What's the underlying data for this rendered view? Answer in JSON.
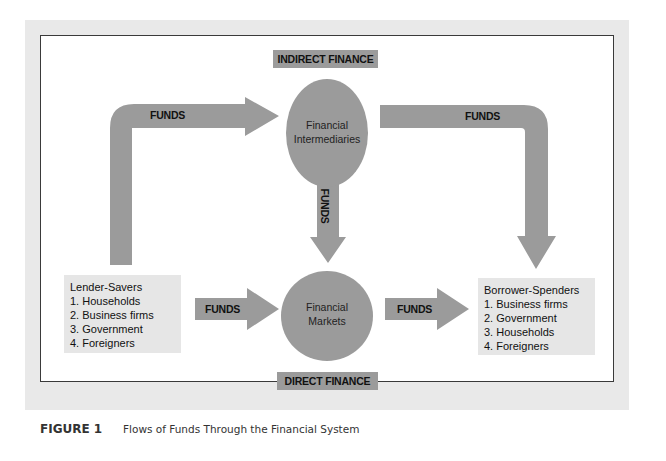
{
  "labels": {
    "indirect_finance": "INDIRECT FINANCE",
    "direct_finance": "DIRECT FINANCE",
    "funds": "FUNDS"
  },
  "nodes": {
    "intermediaries": {
      "line1": "Financial",
      "line2": "Intermediaries"
    },
    "markets": {
      "line1": "Financial",
      "line2": "Markets"
    }
  },
  "lender_savers": {
    "title": "Lender-Savers",
    "items": [
      "1. Households",
      "2. Business firms",
      "3. Government",
      "4. Foreigners"
    ]
  },
  "borrower_spenders": {
    "title": "Borrower-Spenders",
    "items": [
      "1. Business firms",
      "2. Government",
      "3. Households",
      "4. Foreigners"
    ]
  },
  "caption": {
    "number": "FIGURE 1",
    "title": "Flows of Funds Through the Financial System"
  },
  "colors": {
    "arrow": "#9b9b9b",
    "circle": "#9b9b9b",
    "box": "#e6e6e6",
    "panel": "#e9e9e9"
  }
}
